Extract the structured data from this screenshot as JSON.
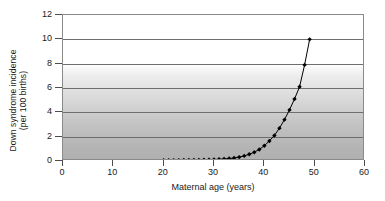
{
  "chart_data": {
    "type": "line",
    "title": "",
    "xlabel": "Maternal age (years)",
    "ylabel": "Down syndrome incidence (per 100 births)",
    "ylabel_line1": "Down syndrome incidence",
    "ylabel_line2": "(per 100 births)",
    "xlim": [
      0,
      60
    ],
    "ylim": [
      0,
      12
    ],
    "xticks": [
      0,
      10,
      20,
      30,
      40,
      50,
      60
    ],
    "yticks": [
      0,
      2,
      4,
      6,
      8,
      10,
      12
    ],
    "grid": "horizontal",
    "legend": "none",
    "marker": "diamond",
    "marker_color": "#000000",
    "line_color": "#000000",
    "plot_background": "vertical gradient white to grey",
    "series": [
      {
        "name": "Down syndrome incidence",
        "x": [
          20,
          21,
          22,
          23,
          24,
          25,
          26,
          27,
          28,
          29,
          30,
          31,
          32,
          33,
          34,
          35,
          36,
          37,
          38,
          39,
          40,
          41,
          42,
          43,
          44,
          45,
          46,
          47,
          48,
          49
        ],
        "y": [
          0.06,
          0.06,
          0.07,
          0.07,
          0.08,
          0.08,
          0.09,
          0.09,
          0.1,
          0.11,
          0.12,
          0.14,
          0.17,
          0.2,
          0.25,
          0.32,
          0.42,
          0.55,
          0.72,
          0.95,
          1.25,
          1.65,
          2.1,
          2.7,
          3.4,
          4.2,
          5.1,
          6.1,
          7.9,
          10.0
        ]
      }
    ]
  }
}
